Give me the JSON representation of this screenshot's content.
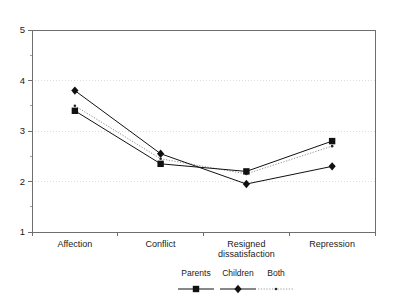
{
  "chart_data": {
    "type": "line",
    "title": "",
    "subtitle": "",
    "xlabel": "",
    "ylabel": "",
    "ylim": [
      1,
      5
    ],
    "yticks": [
      1,
      2,
      3,
      4,
      5
    ],
    "ytick_labels": [
      "1",
      "2",
      "3",
      "4",
      "5"
    ],
    "grid": "horizontal-dotted-faint",
    "gridlines_at": [
      2,
      3,
      4
    ],
    "legend_position": "bottom-center",
    "categories": [
      "Affection",
      "Conflict",
      "Resigned dissatisfaction",
      "Repression"
    ],
    "category_labels": [
      {
        "line1": "Affection",
        "line2": ""
      },
      {
        "line1": "Conflict",
        "line2": ""
      },
      {
        "line1": "Resigned",
        "line2": "dissatisfaction"
      },
      {
        "line1": "Repression",
        "line2": ""
      }
    ],
    "series": [
      {
        "name": "Parents",
        "marker": "filled-square",
        "line_style": "solid",
        "color": "#111111",
        "values": [
          3.4,
          2.35,
          2.2,
          2.8
        ]
      },
      {
        "name": "Children",
        "marker": "filled-diamond",
        "line_style": "solid",
        "color": "#111111",
        "values": [
          3.8,
          2.55,
          1.95,
          2.3
        ]
      },
      {
        "name": "Both",
        "marker": "small-dot",
        "line_style": "dotted",
        "color": "#8f8f8f",
        "values": [
          3.5,
          2.45,
          2.15,
          2.7
        ]
      }
    ]
  },
  "legend": {
    "entries": [
      {
        "label": "Parents",
        "marker": "filled-square",
        "line_style": "solid"
      },
      {
        "label": "Children",
        "marker": "filled-diamond",
        "line_style": "solid"
      },
      {
        "label": "Both",
        "marker": "small-dot",
        "line_style": "dotted"
      }
    ]
  },
  "colors": {
    "background": "#ffffff",
    "axis": "#6e6e6e",
    "gridline": "#cfcfcf",
    "series_solid": "#111111",
    "series_dotted": "#8f8f8f",
    "text": "#1a1a1a"
  }
}
